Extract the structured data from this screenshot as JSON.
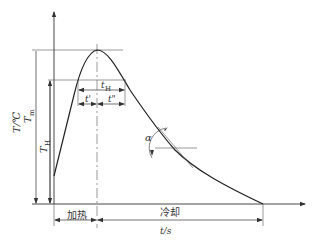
{
  "diagram": {
    "type": "thermal-cycle",
    "axes": {
      "y_label": "T/℃",
      "x_label": "t/s"
    },
    "labels": {
      "peak_temp": "T",
      "peak_temp_sub": "m",
      "hold_temp": "T",
      "hold_temp_sub": "H",
      "hold_time": "t",
      "hold_time_sub": "H",
      "t_prime": "t'",
      "t_double_prime": "t\"",
      "angle": "α",
      "heating": "加热",
      "cooling": "冷却"
    },
    "colors": {
      "line": "#333333",
      "guide": "#555555"
    }
  }
}
